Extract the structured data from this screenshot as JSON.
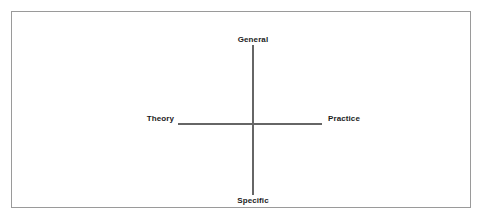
{
  "diagram": {
    "title": "",
    "background_color": "#ffffff",
    "frame": {
      "border_color": "#9a9a9a",
      "fill_color": "#ffffff"
    },
    "axes": {
      "color": "#666666",
      "vertical": {
        "top_label": "General",
        "bottom_label": "Specific"
      },
      "horizontal": {
        "left_label": "Theory",
        "right_label": "Practice"
      }
    },
    "labels": {
      "general": "General",
      "specific": "Specific",
      "theory": "Theory",
      "practice": "Practice"
    },
    "text_color": "#1c1c1c"
  }
}
